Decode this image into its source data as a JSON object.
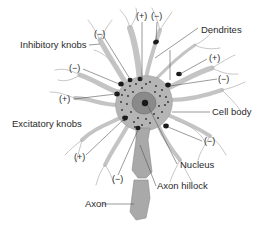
{
  "figure": {
    "colors": {
      "background": "#ffffff",
      "cell_fill": "#b5b5b5",
      "dendrite": "#c4c4c4",
      "nucleus": "#8a8a8a",
      "knob": "#1a1a1a",
      "axon": "#a9a9a9",
      "text": "#2a2a2a"
    }
  },
  "labels": {
    "dendrites": "Dendrites",
    "inhibitory_knobs": "Inhibitory knobs",
    "cell_body": "Cell body",
    "excitatory_knobs": "Excitatory knobs",
    "nucleus": "Nucleus",
    "axon_hillock": "Axon hillock",
    "axon": "Axon"
  },
  "synapse_symbols": [
    {
      "id": "top-plus",
      "text": "(+)"
    },
    {
      "id": "top-minus",
      "text": "(−)"
    },
    {
      "id": "upper-left-minus",
      "text": "(−)"
    },
    {
      "id": "left-minus",
      "text": "(−)"
    },
    {
      "id": "left-plus",
      "text": "(+)"
    },
    {
      "id": "right-plus",
      "text": "(+)"
    },
    {
      "id": "right-minus",
      "text": "(−)"
    },
    {
      "id": "lower-right-minus",
      "text": "(−)"
    },
    {
      "id": "lower-left-plus",
      "text": "(+)"
    },
    {
      "id": "bottom-minus",
      "text": "(−)"
    }
  ]
}
